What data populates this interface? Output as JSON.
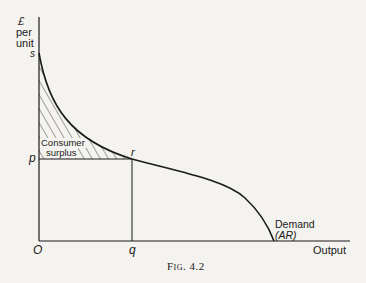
{
  "diagram": {
    "type": "economics-demand-curve",
    "y_axis": {
      "label_line1": "£",
      "label_line2": "per",
      "label_line3": "unit"
    },
    "x_axis": {
      "label": "Output"
    },
    "points": {
      "origin": "O",
      "s": "s",
      "p": "p",
      "r": "r",
      "q": "q"
    },
    "region_label": {
      "line1": "Consumer",
      "line2": "surplus"
    },
    "curve_label": {
      "line1": "Demand",
      "line2": "(AR)"
    },
    "caption": "Fig. 4.2",
    "colors": {
      "ink": "#1a1a1a",
      "paper": "#f4f3ef"
    }
  }
}
